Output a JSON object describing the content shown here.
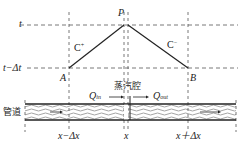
{
  "diagram": {
    "time_labels": {
      "t": "t",
      "t_minus": "t−Δt"
    },
    "points": {
      "P": "P",
      "A": "A",
      "B": "B"
    },
    "characteristics": {
      "c_plus": "C",
      "c_plus_sup": "+",
      "c_minus": "C",
      "c_minus_sup": "−"
    },
    "pipe": {
      "label": "管道",
      "chamber_label": "蒸汽腔",
      "q_in": "Q",
      "q_in_sub": "in",
      "q_out": "Q",
      "q_out_sub": "out"
    },
    "x_labels": {
      "left": "x−Δx",
      "center": "x",
      "right": "x＋Δx"
    },
    "colors": {
      "line": "#222222",
      "dash": "#555555",
      "background": "#ffffff"
    }
  }
}
